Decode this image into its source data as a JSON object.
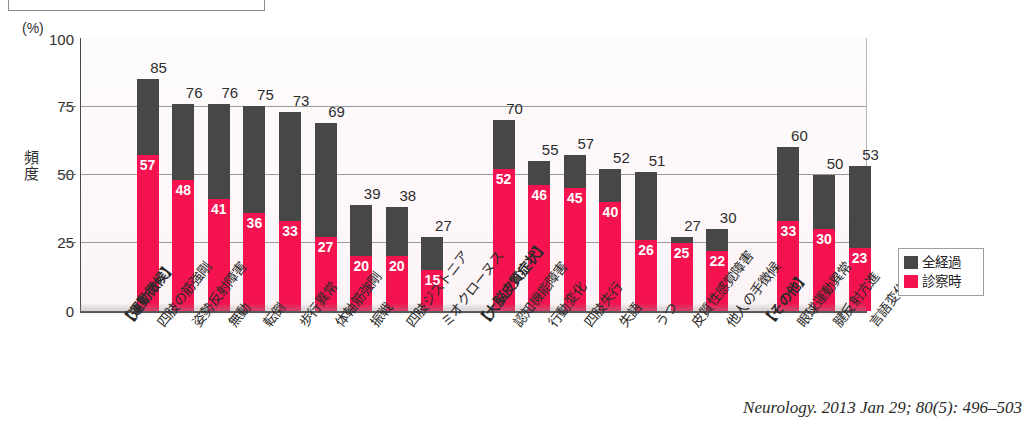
{
  "chart_data": {
    "type": "bar",
    "title": "",
    "xlabel": "",
    "ylabel": "頻度",
    "yunit": "(%)",
    "ylim": [
      0,
      100
    ],
    "yticks": [
      0,
      25,
      50,
      75,
      100
    ],
    "grid": true,
    "legend_position": "right-bottom",
    "stacked_overlay": true,
    "categories": [
      "【運動徴候】",
      "四肢の筋強剛",
      "姿勢反射障害",
      "無動",
      "転倒",
      "歩行異常",
      "体軸筋強剛",
      "振戦",
      "四肢ジストニア",
      "ミオクローヌス",
      "【大脳皮質症状】",
      "認知機能障害",
      "行動変化",
      "四肢失行",
      "失語",
      "うつ",
      "皮質性感覚障害",
      "他人の手徴候",
      "【その他】",
      "眼球運動異常",
      "腱反射亢進",
      "言語変化"
    ],
    "series": [
      {
        "name": "全経過",
        "color": "#474747",
        "values": [
          null,
          85,
          76,
          76,
          75,
          73,
          69,
          39,
          38,
          27,
          null,
          70,
          55,
          57,
          52,
          51,
          27,
          30,
          null,
          60,
          50,
          53
        ]
      },
      {
        "name": "診察時",
        "color": "#f4134e",
        "values": [
          null,
          57,
          48,
          41,
          36,
          33,
          27,
          20,
          20,
          15,
          null,
          52,
          46,
          45,
          40,
          26,
          25,
          22,
          null,
          33,
          30,
          23
        ]
      }
    ]
  },
  "legend": {
    "items": [
      {
        "label": "全経過",
        "color": "#474747"
      },
      {
        "label": "診察時",
        "color": "#f4134e"
      }
    ]
  },
  "axis": {
    "unit_label": "(%)",
    "y_title": "頻度",
    "ticks": [
      "100",
      "75",
      "50",
      "25",
      "0"
    ]
  },
  "citation": "Neurology. 2013 Jan 29; 80(5): 496–503"
}
